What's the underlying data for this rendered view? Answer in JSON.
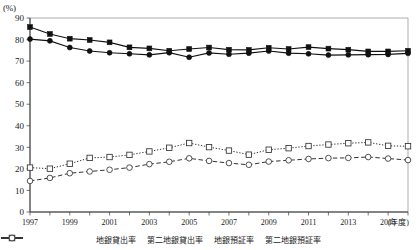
{
  "axis": {
    "y_unit": "(%)",
    "y_ticks": [
      0,
      10,
      20,
      30,
      40,
      50,
      60,
      70,
      80,
      90
    ],
    "x_unit": "(年度)",
    "x_tick_labels": [
      "1997",
      "1999",
      "2001",
      "2003",
      "2005",
      "2007",
      "2009",
      "2011",
      "2013",
      "2015"
    ]
  },
  "legend": {
    "items": [
      {
        "label": "地銀貸出率",
        "marker": "filled-circle",
        "line": "solid",
        "color": "#111111"
      },
      {
        "label": "第二地銀貸出率",
        "marker": "filled-square",
        "line": "solid",
        "color": "#111111"
      },
      {
        "label": "地銀預証率",
        "marker": "open-square",
        "line": "dotted",
        "color": "#333333"
      },
      {
        "label": "第二地銀預証率",
        "marker": "open-circle",
        "line": "dashed",
        "color": "#333333"
      }
    ]
  },
  "chart_data": {
    "type": "line",
    "title": "",
    "xlabel": "(年度)",
    "ylabel": "(%)",
    "ylim": [
      0,
      90
    ],
    "grid": false,
    "legend_position": "bottom",
    "x": [
      1997,
      1998,
      1999,
      2000,
      2001,
      2002,
      2003,
      2004,
      2005,
      2006,
      2007,
      2008,
      2009,
      2010,
      2011,
      2012,
      2013,
      2014,
      2015,
      2016
    ],
    "series": [
      {
        "name": "第二地銀貸出率",
        "marker": "filled-square",
        "line": "solid",
        "values": [
          85.8,
          82.6,
          80.4,
          79.8,
          78.7,
          76.4,
          75.9,
          74.8,
          75.6,
          76.3,
          75.3,
          75.2,
          76.2,
          75.6,
          76.5,
          75.8,
          75.3,
          74.5,
          74.5,
          74.8
        ]
      },
      {
        "name": "地銀貸出率",
        "marker": "filled-circle",
        "line": "solid",
        "values": [
          80.2,
          79.4,
          76.3,
          74.7,
          73.9,
          73.4,
          72.9,
          73.9,
          71.8,
          73.8,
          73.2,
          73.7,
          74.7,
          73.7,
          73.4,
          72.8,
          72.9,
          73.0,
          73.1,
          73.6
        ]
      },
      {
        "name": "地銀預証率",
        "marker": "open-square",
        "line": "dotted",
        "values": [
          20.6,
          20.1,
          22.4,
          25.1,
          25.5,
          26.5,
          28.1,
          29.8,
          32.0,
          30.1,
          28.5,
          26.6,
          28.9,
          29.6,
          30.6,
          31.3,
          31.9,
          32.3,
          30.7,
          30.5
        ]
      },
      {
        "name": "第二地銀預証率",
        "marker": "open-circle",
        "line": "dashed",
        "values": [
          14.4,
          15.8,
          18.0,
          18.8,
          19.6,
          20.6,
          22.2,
          23.3,
          24.9,
          23.7,
          22.7,
          21.9,
          23.4,
          24.0,
          24.6,
          25.0,
          25.1,
          25.5,
          24.8,
          24.1
        ]
      }
    ]
  }
}
